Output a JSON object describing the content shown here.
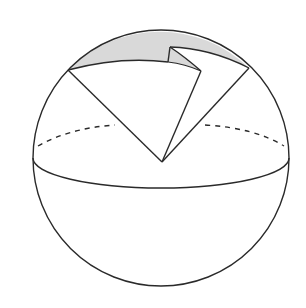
{
  "diagram": {
    "type": "sphere-with-cut-sector",
    "colors": {
      "stroke": "#2a2a2a",
      "shade": "#d9d9d9",
      "background": "#ffffff"
    },
    "sphere": {
      "cx": 161,
      "cy": 158,
      "r": 128
    },
    "equator": {
      "rx": 128,
      "ry": 30
    },
    "sector": {
      "apex": [
        162,
        162
      ],
      "left_point": [
        68,
        70
      ],
      "right_point": [
        249,
        68
      ],
      "notch_top": [
        170,
        47
      ],
      "notch_corner": [
        168,
        62
      ],
      "notch_tip": [
        201,
        71
      ]
    },
    "labels": []
  }
}
